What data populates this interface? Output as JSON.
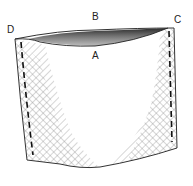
{
  "diagram": {
    "labels": [
      {
        "id": "A",
        "text": "A",
        "x": 92,
        "y": 51
      },
      {
        "id": "B",
        "text": "B",
        "x": 92,
        "y": 12
      },
      {
        "id": "C",
        "text": "C",
        "x": 174,
        "y": 15
      },
      {
        "id": "D",
        "text": "D",
        "x": 7,
        "y": 25
      }
    ],
    "colors": {
      "outline": "#333333",
      "stitch": "#111111",
      "hatch": "#777777",
      "shade": "#222222"
    }
  }
}
